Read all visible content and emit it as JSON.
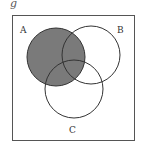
{
  "figure": {
    "label": "g"
  },
  "diagram": {
    "type": "venn",
    "sets": [
      {
        "name": "A",
        "shaded": true
      },
      {
        "name": "B",
        "shaded": false
      },
      {
        "name": "C",
        "shaded": false
      }
    ],
    "shaded_region": "A",
    "colors": {
      "shade": "#7a7a7a",
      "stroke": "#333333",
      "frame": "#555555",
      "background": "#ffffff"
    }
  }
}
